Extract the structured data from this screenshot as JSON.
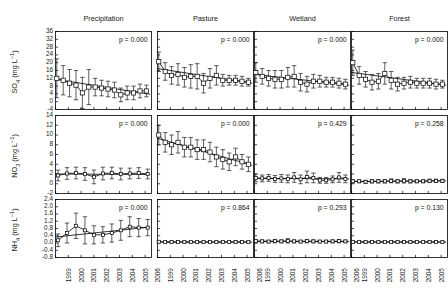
{
  "figure": {
    "columns": [
      "Precipitation",
      "Pasture",
      "Wetland",
      "Forest"
    ],
    "row_labels": [
      "SO4 (mg L-1)",
      "NO3 (mg L-1)",
      "NH4 (mg L-1)"
    ],
    "x_tick_labels": [
      "1999",
      "2000",
      "2001",
      "2002",
      "2003",
      "2004",
      "2005",
      "2006"
    ],
    "line_color": "#000000",
    "marker_color": "#ffffff",
    "axis_color": "#000000"
  },
  "chart_data": [
    {
      "type": "line",
      "title": "SO4 - Precipitation",
      "row": "SO4",
      "column": "Precipitation",
      "xlabel": "",
      "ylabel": "SO4 (mg L-1)",
      "ylim": [
        -4,
        36
      ],
      "yticks": [
        -4,
        0,
        4,
        8,
        12,
        16,
        20,
        24,
        28,
        32,
        36
      ],
      "xlim": [
        1999,
        2006.5
      ],
      "grid": false,
      "annotation": "p = 0.000",
      "x": [
        1999.1,
        1999.6,
        2000.1,
        2000.6,
        2001.1,
        2001.6,
        2002.1,
        2002.6,
        2003.1,
        2003.6,
        2004.1,
        2004.6,
        2005.1,
        2005.6,
        2006.1
      ],
      "values": [
        12.0,
        11.0,
        9.5,
        8.5,
        4.5,
        7.5,
        7.5,
        7.0,
        6.5,
        6.0,
        3.5,
        4.5,
        4.5,
        5.5,
        5.5
      ],
      "errors": [
        10.0,
        7.5,
        7.0,
        7.5,
        8.0,
        9.0,
        4.5,
        4.0,
        4.0,
        4.0,
        3.5,
        3.5,
        3.5,
        3.5,
        3.0
      ],
      "trend": {
        "x0": 1999.0,
        "y0": 11.5,
        "x1": 2006.4,
        "y1": 3.8
      }
    },
    {
      "type": "line",
      "title": "SO4 - Pasture",
      "row": "SO4",
      "column": "Pasture",
      "ylim": [
        -4,
        36
      ],
      "yticks": [
        -4,
        0,
        4,
        8,
        12,
        16,
        20,
        24,
        28,
        32,
        36
      ],
      "xlim": [
        1999,
        2006.5
      ],
      "grid": false,
      "annotation": "p = 0.000",
      "x": [
        1999.1,
        1999.6,
        2000.1,
        2000.6,
        2001.1,
        2001.6,
        2002.1,
        2002.6,
        2003.1,
        2003.6,
        2004.1,
        2004.6,
        2005.1,
        2005.6,
        2006.1
      ],
      "values": [
        20.5,
        15.5,
        13.5,
        14.0,
        12.5,
        13.0,
        13.0,
        9.5,
        12.0,
        13.5,
        11.0,
        11.0,
        11.0,
        10.5,
        10.0
      ],
      "errors": [
        5.0,
        4.5,
        4.5,
        5.5,
        5.0,
        6.0,
        6.5,
        5.0,
        5.0,
        5.0,
        3.0,
        2.5,
        2.5,
        2.5,
        2.0
      ],
      "trend": {
        "x0": 1999.0,
        "y0": 17.0,
        "x1": 2006.4,
        "y1": 9.5
      }
    },
    {
      "type": "line",
      "title": "SO4 - Wetland",
      "row": "SO4",
      "column": "Wetland",
      "ylim": [
        -4,
        36
      ],
      "yticks": [
        -4,
        0,
        4,
        8,
        12,
        16,
        20,
        24,
        28,
        32,
        36
      ],
      "xlim": [
        1999,
        2006.5
      ],
      "grid": false,
      "annotation": "p = 0.000",
      "x": [
        1999.1,
        1999.6,
        2000.1,
        2000.6,
        2001.1,
        2001.6,
        2002.1,
        2002.6,
        2003.1,
        2003.6,
        2004.1,
        2004.6,
        2005.1,
        2005.6,
        2006.1
      ],
      "values": [
        15.0,
        13.0,
        12.0,
        11.5,
        11.5,
        12.5,
        13.0,
        10.0,
        9.0,
        10.5,
        10.5,
        10.0,
        10.0,
        9.5,
        9.0
      ],
      "errors": [
        5.0,
        4.0,
        4.0,
        4.5,
        4.5,
        5.0,
        5.5,
        4.5,
        4.0,
        3.5,
        3.0,
        2.5,
        2.5,
        2.5,
        2.5
      ],
      "trend": {
        "x0": 1999.0,
        "y0": 14.0,
        "x1": 2006.4,
        "y1": 8.5
      }
    },
    {
      "type": "line",
      "title": "SO4 - Forest",
      "row": "SO4",
      "column": "Forest",
      "ylim": [
        -4,
        36
      ],
      "yticks": [
        -4,
        0,
        4,
        8,
        12,
        16,
        20,
        24,
        28,
        32,
        36
      ],
      "xlim": [
        1999,
        2006.5
      ],
      "grid": false,
      "annotation": "p = 0.000",
      "x": [
        1999.1,
        1999.6,
        2000.1,
        2000.6,
        2001.1,
        2001.6,
        2002.1,
        2002.6,
        2003.1,
        2003.6,
        2004.1,
        2004.6,
        2005.1,
        2005.6,
        2006.1
      ],
      "values": [
        20.0,
        13.5,
        11.5,
        10.0,
        10.5,
        14.5,
        11.0,
        9.0,
        9.5,
        10.0,
        9.5,
        9.5,
        9.5,
        9.0,
        9.0
      ],
      "errors": [
        6.5,
        4.5,
        4.0,
        4.0,
        4.0,
        5.5,
        4.5,
        3.5,
        3.0,
        3.0,
        2.5,
        2.5,
        2.5,
        2.5,
        2.0
      ],
      "trend": {
        "x0": 1999.0,
        "y0": 15.0,
        "x1": 2006.4,
        "y1": 8.5
      }
    },
    {
      "type": "line",
      "title": "NO3 - Precipitation",
      "row": "NO3",
      "column": "Precipitation",
      "ylabel": "NO3 (mg L-1)",
      "ylim": [
        -2,
        14
      ],
      "yticks": [
        -2,
        0,
        2,
        4,
        6,
        8,
        10,
        12,
        14
      ],
      "xlim": [
        1999,
        2006.5
      ],
      "grid": false,
      "annotation": "p = 0.000",
      "x": [
        1999.2,
        1999.9,
        2000.6,
        2001.3,
        2002.0,
        2002.7,
        2003.4,
        2004.1,
        2004.8,
        2005.5,
        2006.2
      ],
      "values": [
        1.7,
        2.1,
        2.2,
        2.0,
        1.4,
        2.1,
        2.2,
        2.0,
        2.1,
        2.2,
        2.0
      ],
      "errors": [
        1.1,
        1.2,
        1.2,
        1.3,
        1.4,
        1.3,
        1.2,
        1.2,
        1.1,
        1.1,
        1.0
      ],
      "trend": {
        "x0": 1999.0,
        "y0": 2.0,
        "x1": 2006.4,
        "y1": 1.9
      }
    },
    {
      "type": "line",
      "title": "NO3 - Pasture",
      "row": "NO3",
      "column": "Pasture",
      "ylim": [
        -2,
        14
      ],
      "yticks": [
        -2,
        0,
        2,
        4,
        6,
        8,
        10,
        12,
        14
      ],
      "xlim": [
        1999,
        2006.5
      ],
      "grid": false,
      "annotation": "p = 0.000",
      "x": [
        1999.1,
        1999.6,
        2000.1,
        2000.6,
        2001.1,
        2001.6,
        2002.1,
        2002.6,
        2003.1,
        2003.6,
        2004.1,
        2004.6,
        2005.1,
        2005.6,
        2006.1
      ],
      "values": [
        10.0,
        8.5,
        8.0,
        8.5,
        7.5,
        7.5,
        7.0,
        7.0,
        6.5,
        5.5,
        5.0,
        4.5,
        5.5,
        4.5,
        4.0
      ],
      "errors": [
        2.0,
        2.0,
        2.0,
        2.2,
        2.0,
        2.0,
        2.0,
        2.0,
        2.0,
        2.0,
        2.0,
        1.8,
        1.8,
        1.5,
        1.5
      ],
      "trend": {
        "x0": 1999.0,
        "y0": 9.3,
        "x1": 2006.4,
        "y1": 3.8
      }
    },
    {
      "type": "line",
      "title": "NO3 - Wetland",
      "row": "NO3",
      "column": "Wetland",
      "ylim": [
        -2,
        14
      ],
      "yticks": [
        -2,
        0,
        2,
        4,
        6,
        8,
        10,
        12,
        14
      ],
      "xlim": [
        1999,
        2006.5
      ],
      "grid": false,
      "annotation": "p = 0.429",
      "x": [
        1999.1,
        1999.6,
        2000.1,
        2000.6,
        2001.1,
        2001.6,
        2002.1,
        2002.6,
        2003.1,
        2003.6,
        2004.1,
        2004.6,
        2005.1,
        2005.6,
        2006.1
      ],
      "values": [
        1.2,
        1.1,
        1.2,
        1.0,
        1.1,
        1.0,
        1.3,
        0.9,
        1.4,
        1.2,
        0.7,
        0.7,
        0.9,
        1.3,
        1.0
      ],
      "errors": [
        0.8,
        0.7,
        0.7,
        0.7,
        0.8,
        0.8,
        1.0,
        0.9,
        1.2,
        1.0,
        0.6,
        0.6,
        0.7,
        1.0,
        0.8
      ],
      "trend": {
        "x0": 1999.0,
        "y0": 1.1,
        "x1": 2006.4,
        "y1": 1.0
      }
    },
    {
      "type": "line",
      "title": "NO3 - Forest",
      "row": "NO3",
      "column": "Forest",
      "ylim": [
        -2,
        14
      ],
      "yticks": [
        -2,
        0,
        2,
        4,
        6,
        8,
        10,
        12,
        14
      ],
      "xlim": [
        1999,
        2006.5
      ],
      "grid": false,
      "annotation": "p = 0.258",
      "x": [
        1999.1,
        1999.6,
        2000.1,
        2000.6,
        2001.1,
        2001.6,
        2002.1,
        2002.6,
        2003.1,
        2003.6,
        2004.1,
        2004.6,
        2005.1,
        2005.6,
        2006.1
      ],
      "values": [
        0.5,
        0.5,
        0.4,
        0.5,
        0.5,
        0.5,
        0.6,
        0.5,
        0.6,
        0.5,
        0.5,
        0.5,
        0.6,
        0.6,
        0.6
      ],
      "errors": [
        0.35,
        0.3,
        0.3,
        0.35,
        0.35,
        0.35,
        0.4,
        0.35,
        0.45,
        0.35,
        0.3,
        0.3,
        0.35,
        0.35,
        0.3
      ],
      "trend": {
        "x0": 1999.0,
        "y0": 0.45,
        "x1": 2006.4,
        "y1": 0.6
      }
    },
    {
      "type": "line",
      "title": "NH4 - Precipitation",
      "row": "NH4",
      "column": "Precipitation",
      "ylabel": "NH4 (mg L-1)",
      "ylim": [
        -0.8,
        2.4
      ],
      "yticks": [
        -0.8,
        -0.4,
        0.0,
        0.4,
        0.8,
        1.2,
        1.6,
        2.0,
        2.4
      ],
      "xlim": [
        1999,
        2006.5
      ],
      "grid": false,
      "annotation": "p = 0.000",
      "x": [
        1999.2,
        1999.9,
        2000.6,
        2001.3,
        2002.0,
        2002.7,
        2003.4,
        2004.1,
        2004.8,
        2005.5,
        2006.2
      ],
      "values": [
        0.15,
        0.55,
        0.95,
        0.7,
        0.45,
        0.45,
        0.55,
        0.7,
        0.9,
        0.85,
        0.85
      ],
      "errors": [
        0.35,
        0.55,
        0.7,
        0.75,
        0.5,
        0.45,
        0.5,
        0.55,
        0.55,
        0.5,
        0.45
      ],
      "trend": {
        "x0": 1999.0,
        "y0": 0.33,
        "x1": 2006.4,
        "y1": 0.88
      }
    },
    {
      "type": "line",
      "title": "NH4 - Pasture",
      "row": "NH4",
      "column": "Pasture",
      "ylim": [
        -0.8,
        2.4
      ],
      "yticks": [
        -0.8,
        -0.4,
        0.0,
        0.4,
        0.8,
        1.2,
        1.6,
        2.0,
        2.4
      ],
      "xlim": [
        1999,
        2006.5
      ],
      "grid": false,
      "annotation": "p = 0.864",
      "x": [
        1999.1,
        1999.6,
        2000.1,
        2000.6,
        2001.1,
        2001.6,
        2002.1,
        2002.6,
        2003.1,
        2003.6,
        2004.1,
        2004.6,
        2005.1,
        2005.6,
        2006.1
      ],
      "values": [
        0.07,
        0.05,
        0.05,
        0.06,
        0.05,
        0.05,
        0.05,
        0.05,
        0.05,
        0.05,
        0.05,
        0.05,
        0.06,
        0.06,
        0.05
      ],
      "errors": [
        0.05,
        0.04,
        0.04,
        0.05,
        0.04,
        0.04,
        0.04,
        0.04,
        0.04,
        0.04,
        0.04,
        0.04,
        0.05,
        0.05,
        0.04
      ],
      "trend": {
        "x0": 1999.0,
        "y0": 0.055,
        "x1": 2006.4,
        "y1": 0.05
      }
    },
    {
      "type": "line",
      "title": "NH4 - Wetland",
      "row": "NH4",
      "column": "Wetland",
      "ylim": [
        -0.8,
        2.4
      ],
      "yticks": [
        -0.8,
        -0.4,
        0.0,
        0.4,
        0.8,
        1.2,
        1.6,
        2.0,
        2.4
      ],
      "xlim": [
        1999,
        2006.5
      ],
      "grid": false,
      "annotation": "p = 0.293",
      "x": [
        1999.1,
        1999.6,
        2000.1,
        2000.6,
        2001.1,
        2001.6,
        2002.1,
        2002.6,
        2003.1,
        2003.6,
        2004.1,
        2004.6,
        2005.1,
        2005.6,
        2006.1
      ],
      "values": [
        0.1,
        0.09,
        0.08,
        0.1,
        0.09,
        0.12,
        0.09,
        0.08,
        0.1,
        0.09,
        0.08,
        0.08,
        0.09,
        0.1,
        0.09
      ],
      "errors": [
        0.09,
        0.08,
        0.07,
        0.09,
        0.08,
        0.12,
        0.08,
        0.07,
        0.09,
        0.08,
        0.07,
        0.07,
        0.08,
        0.09,
        0.07
      ],
      "trend": {
        "x0": 1999.0,
        "y0": 0.1,
        "x1": 2006.4,
        "y1": 0.085
      }
    },
    {
      "type": "line",
      "title": "NH4 - Forest",
      "row": "NH4",
      "column": "Forest",
      "ylim": [
        -0.8,
        2.4
      ],
      "yticks": [
        -0.8,
        -0.4,
        0.0,
        0.4,
        0.8,
        1.2,
        1.6,
        2.0,
        2.4
      ],
      "xlim": [
        1999,
        2006.5
      ],
      "grid": false,
      "annotation": "p = 0.130",
      "x": [
        1999.1,
        1999.6,
        2000.1,
        2000.6,
        2001.1,
        2001.6,
        2002.1,
        2002.6,
        2003.1,
        2003.6,
        2004.1,
        2004.6,
        2005.1,
        2005.6,
        2006.1
      ],
      "values": [
        0.06,
        0.05,
        0.05,
        0.06,
        0.05,
        0.05,
        0.06,
        0.05,
        0.06,
        0.05,
        0.05,
        0.05,
        0.06,
        0.06,
        0.05
      ],
      "errors": [
        0.05,
        0.04,
        0.04,
        0.05,
        0.04,
        0.04,
        0.05,
        0.04,
        0.05,
        0.04,
        0.04,
        0.04,
        0.05,
        0.05,
        0.04
      ],
      "trend": {
        "x0": 1999.0,
        "y0": 0.055,
        "x1": 2006.4,
        "y1": 0.05
      }
    }
  ]
}
